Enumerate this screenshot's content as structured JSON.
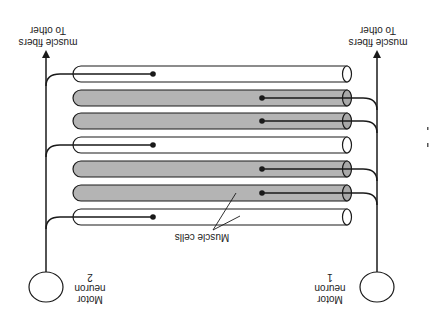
{
  "diagram": {
    "orientation": "rotated 180 degrees",
    "colors": {
      "line": "#1a1a1a",
      "tube_fill_innervated_by_1": "#b4b4b4",
      "tube_fill_innervated_by_2": "#ffffff",
      "background": "#ffffff"
    },
    "neurons": [
      {
        "id": "motor-neuron-1",
        "label_line1": "Motor",
        "label_line2": "neuron",
        "label_line3": "1"
      },
      {
        "id": "motor-neuron-2",
        "label_line1": "Motor",
        "label_line2": "neuron",
        "label_line3": "2"
      }
    ],
    "arrow_labels": [
      {
        "line1": "To other",
        "line2": "muscle fibers"
      },
      {
        "line1": "To other",
        "line2": "muscle fibers"
      }
    ],
    "muscle_cells_label": "Muscle cells",
    "fibers": [
      {
        "index": 1,
        "innervated_by": "motor-neuron-2",
        "shaded": false
      },
      {
        "index": 2,
        "innervated_by": "motor-neuron-1",
        "shaded": true
      },
      {
        "index": 3,
        "innervated_by": "motor-neuron-1",
        "shaded": true
      },
      {
        "index": 4,
        "innervated_by": "motor-neuron-2",
        "shaded": false
      },
      {
        "index": 5,
        "innervated_by": "motor-neuron-1",
        "shaded": true
      },
      {
        "index": 6,
        "innervated_by": "motor-neuron-1",
        "shaded": true
      },
      {
        "index": 7,
        "innervated_by": "motor-neuron-2",
        "shaded": false
      }
    ],
    "side_marks": "a"
  }
}
